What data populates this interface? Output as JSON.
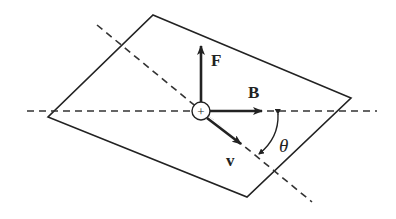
{
  "diagram": {
    "labels": {
      "force": "F",
      "field": "B",
      "velocity": "v",
      "angle": "θ",
      "charge": "+"
    },
    "colors": {
      "stroke": "#222222",
      "background": "#ffffff"
    },
    "geometry": {
      "plane_vertices": [
        [
          153,
          15
        ],
        [
          351,
          98
        ],
        [
          247,
          197
        ],
        [
          48,
          117
        ]
      ],
      "center": [
        201,
        111
      ],
      "charge_radius": 9,
      "horizontal_dashed": [
        [
          27,
          111
        ],
        [
          377,
          111
        ]
      ],
      "diagonal_dashed": [
        [
          97,
          25
        ],
        [
          312,
          202
        ]
      ],
      "arrow_F_tip": [
        201,
        44
      ],
      "arrow_B_tip": [
        264,
        111
      ],
      "arrow_v_tip": [
        242,
        145
      ]
    }
  }
}
